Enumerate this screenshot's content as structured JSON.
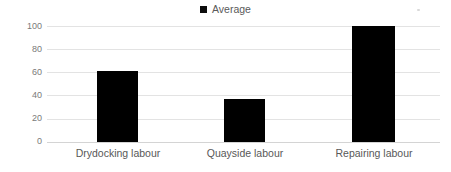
{
  "chart_data": {
    "type": "bar",
    "title": "",
    "subtitle": "",
    "xlabel": "",
    "ylabel": "Labour (man-day) (%)",
    "categories": [
      "Drydocking labour",
      "Quayside labour",
      "Repairing labour"
    ],
    "series": [
      {
        "name": "Average",
        "values": [
          61,
          37,
          100
        ],
        "color": "#000000"
      }
    ],
    "ylim": [
      0,
      100
    ],
    "yticks": [
      0,
      20,
      40,
      60,
      80,
      100
    ],
    "ytick_labels": [
      "0",
      "20",
      "40",
      "60",
      "80",
      "100"
    ],
    "grid": "horizontal",
    "legend": {
      "position": "top-center",
      "entries": [
        {
          "label": "Average",
          "marker": "square",
          "color": "#000000"
        }
      ]
    },
    "annotations": []
  },
  "legend": {
    "average_label": "Average"
  },
  "axes": {
    "y_title": "Labour (man-day) (%)",
    "y_ticks": [
      "100",
      "80",
      "60",
      "40",
      "20",
      "0"
    ],
    "x_categories": [
      "Drydocking labour",
      "Quayside labour",
      "Repairing labour"
    ]
  },
  "colors": {
    "bar": "#000000",
    "gridline": "#e3e3e3",
    "baseline": "#d4d4d4",
    "tick_text": "#7a7a7a",
    "axis_title": "#595959",
    "category_text": "#585858",
    "background": "#ffffff"
  }
}
